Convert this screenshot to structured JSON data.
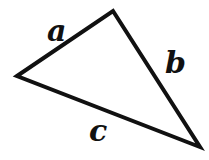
{
  "figure": {
    "type": "geometry-diagram",
    "shape": "triangle",
    "background_color": "#ffffff",
    "stroke_color": "#111111",
    "stroke_width": 4,
    "text_color": "#111111",
    "vertices": [
      {
        "name": "left-vertex",
        "x": 17,
        "y": 76
      },
      {
        "name": "top-vertex",
        "x": 113,
        "y": 11
      },
      {
        "name": "bottom-right-vertex",
        "x": 200,
        "y": 147
      }
    ],
    "sides": [
      {
        "id": "side-a",
        "label": "a",
        "from": "left-vertex",
        "to": "top-vertex",
        "label_x": 58,
        "label_y": 32
      },
      {
        "id": "side-b",
        "label": "b",
        "from": "top-vertex",
        "to": "bottom-right-vertex",
        "label_x": 175,
        "label_y": 64
      },
      {
        "id": "side-c",
        "label": "c",
        "from": "left-vertex",
        "to": "bottom-right-vertex",
        "label_x": 100,
        "label_y": 132
      }
    ]
  }
}
